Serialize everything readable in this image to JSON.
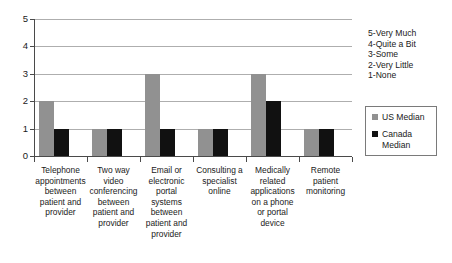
{
  "chart_data": {
    "type": "bar",
    "title": "",
    "subtitle": "",
    "xlabel": "",
    "ylabel": "",
    "ylim": [
      0,
      5
    ],
    "yticks": [
      0,
      1,
      2,
      3,
      4,
      5
    ],
    "grid": true,
    "legend_position": "right",
    "orientation": "vertical",
    "grouping": "grouped",
    "categories": [
      "Telephone appointments between patient and provider",
      "Two way video conferencing between patient and provider",
      "Email or electronic portal systems between patient and provider",
      "Consulting a specialist online",
      "Medically related applications on a phone or portal device",
      "Remote patient monitoring"
    ],
    "series": [
      {
        "name": "US Median",
        "color": "#919191",
        "values": [
          2,
          1,
          3,
          1,
          3,
          1
        ]
      },
      {
        "name": "Canada Median",
        "color": "#111111",
        "values": [
          1,
          1,
          1,
          1,
          2,
          1
        ]
      }
    ],
    "scale_legend": [
      "5-Very Much",
      "4-Quite a Bit",
      "3-Some",
      "2-Very Little",
      "1-None"
    ]
  },
  "axis": {
    "y_tick_labels": [
      "5",
      "4",
      "3",
      "2",
      "1",
      "0"
    ]
  },
  "legend": {
    "series": [
      {
        "label": "US Median"
      },
      {
        "label": "Canada Median"
      }
    ]
  },
  "colors": {
    "us_median": "#919191",
    "canada_median": "#111111",
    "gridline": "#aeaeae",
    "axis": "#4a4a4a",
    "text": "#1a1a1a",
    "background": "#ffffff"
  },
  "caption": ""
}
